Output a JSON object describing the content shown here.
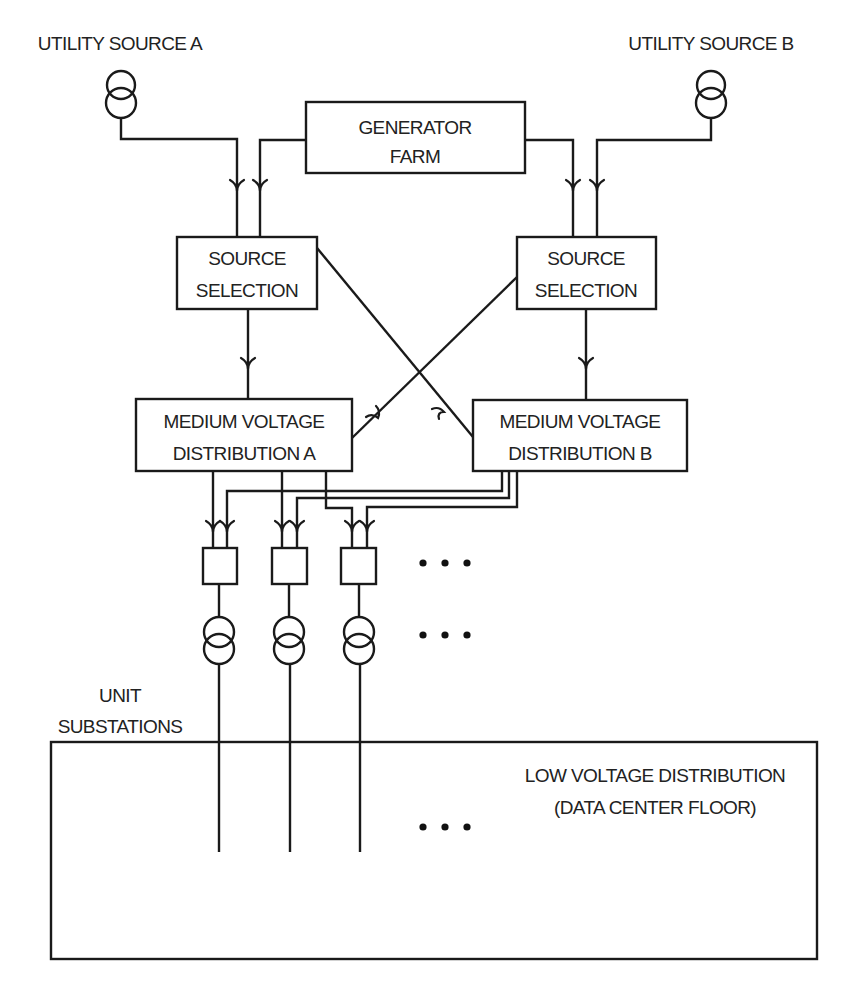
{
  "diagram": {
    "labels": {
      "utility_a": "UTILITY SOURCE A",
      "utility_b": "UTILITY SOURCE B",
      "generator_line1": "GENERATOR",
      "generator_line2": "FARM",
      "source_a_line1": "SOURCE",
      "source_a_line2": "SELECTION",
      "source_b_line1": "SOURCE",
      "source_b_line2": "SELECTION",
      "mv_a_line1": "MEDIUM VOLTAGE",
      "mv_a_line2": "DISTRIBUTION A",
      "mv_b_line1": "MEDIUM VOLTAGE",
      "mv_b_line2": "DISTRIBUTION B",
      "unit_line1": "UNIT",
      "unit_line2": "SUBSTATIONS",
      "lv_line1": "LOW VOLTAGE DISTRIBUTION",
      "lv_line2": "(DATA CENTER FLOOR)"
    },
    "icons": {
      "utility_transformer": "transformer-icon",
      "unit_transformer": "transformer-icon",
      "ellipsis": "ellipsis-dots",
      "arrow": "arrowhead-down"
    },
    "colors": {
      "stroke": "#1a1a1a",
      "text": "#222222",
      "background": "#ffffff"
    }
  }
}
